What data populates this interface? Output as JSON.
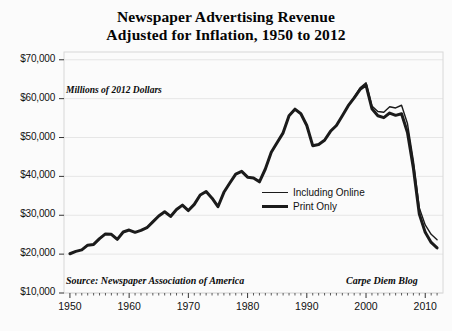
{
  "chart_data": {
    "type": "line",
    "title": "Newspaper Advertising Revenue Adjusted for Inflation, 1950 to 2012",
    "title_line1": "Newspaper Advertising Revenue",
    "title_line2": "Adjusted for Inflation, 1950 to 2012",
    "xlabel": "",
    "ylabel": "Millions of 2012 Dollars",
    "units_note": "Millions of 2012 Dollars",
    "source_note": "Source: Newspaper Association of America",
    "credit_note": "Carpe Diem Blog",
    "xlim": [
      1949,
      2013
    ],
    "ylim": [
      10000,
      72000
    ],
    "grid": true,
    "grid_axis": "y",
    "legend_position": "center-right",
    "y_ticks": [
      10000,
      20000,
      30000,
      40000,
      50000,
      60000,
      70000
    ],
    "y_tick_labels": [
      "$10,000",
      "$20,000",
      "$30,000",
      "$40,000",
      "$50,000",
      "$60,000",
      "$70,000"
    ],
    "x_ticks": [
      1950,
      1960,
      1970,
      1980,
      1990,
      2000,
      2010
    ],
    "x_tick_labels": [
      "1950",
      "1960",
      "1970",
      "1980",
      "1990",
      "2000",
      "2010"
    ],
    "x_minor_tick_interval": 1,
    "line_color": "#1b1b1b",
    "x": [
      1950,
      1951,
      1952,
      1953,
      1954,
      1955,
      1956,
      1957,
      1958,
      1959,
      1960,
      1961,
      1962,
      1963,
      1964,
      1965,
      1966,
      1967,
      1968,
      1969,
      1970,
      1971,
      1972,
      1973,
      1974,
      1975,
      1976,
      1977,
      1978,
      1979,
      1980,
      1981,
      1982,
      1983,
      1984,
      1985,
      1986,
      1987,
      1988,
      1989,
      1990,
      1991,
      1992,
      1993,
      1994,
      1995,
      1996,
      1997,
      1998,
      1999,
      2000,
      2001,
      2002,
      2003,
      2004,
      2005,
      2006,
      2007,
      2008,
      2009,
      2010,
      2011,
      2012
    ],
    "series": [
      {
        "name": "Print Only",
        "style": "thick",
        "line_width": 3,
        "values": [
          20100,
          20700,
          21100,
          22300,
          22500,
          24000,
          25200,
          25100,
          23800,
          25700,
          26200,
          25600,
          26100,
          26800,
          28300,
          29800,
          30900,
          29700,
          31500,
          32600,
          31200,
          32800,
          35200,
          36100,
          34400,
          32200,
          35900,
          38300,
          40600,
          41300,
          39800,
          39600,
          38600,
          41900,
          46200,
          48700,
          51200,
          55600,
          57300,
          56100,
          53100,
          47900,
          48200,
          49300,
          51600,
          53100,
          55600,
          58200,
          60200,
          62400,
          63500,
          57400,
          55600,
          55100,
          56300,
          55700,
          56100,
          51300,
          42100,
          30300,
          25600,
          23000,
          21600
        ]
      },
      {
        "name": "Including Online",
        "style": "thin",
        "line_width": 1.4,
        "values": [
          20100,
          20700,
          21100,
          22300,
          22500,
          24000,
          25200,
          25100,
          23800,
          25700,
          26200,
          25600,
          26100,
          26800,
          28300,
          29800,
          30900,
          29700,
          31500,
          32600,
          31200,
          32800,
          35200,
          36100,
          34400,
          32200,
          35900,
          38300,
          40600,
          41300,
          39800,
          39600,
          38600,
          41900,
          46200,
          48700,
          51200,
          55600,
          57300,
          56100,
          53100,
          47900,
          48200,
          49300,
          51600,
          53100,
          55600,
          58200,
          60400,
          62800,
          64100,
          58100,
          56700,
          56500,
          57900,
          57600,
          58300,
          53600,
          44000,
          31900,
          27500,
          25100,
          23700
        ]
      }
    ],
    "annotations": [
      {
        "text": "Millions of 2012 Dollars",
        "x": 1951,
        "y": 65500
      },
      {
        "text": "Source: Newspaper Association of America",
        "x": 1951,
        "y": 12600
      },
      {
        "text": "Carpe Diem Blog",
        "x": 2001,
        "y": 12600
      }
    ]
  }
}
